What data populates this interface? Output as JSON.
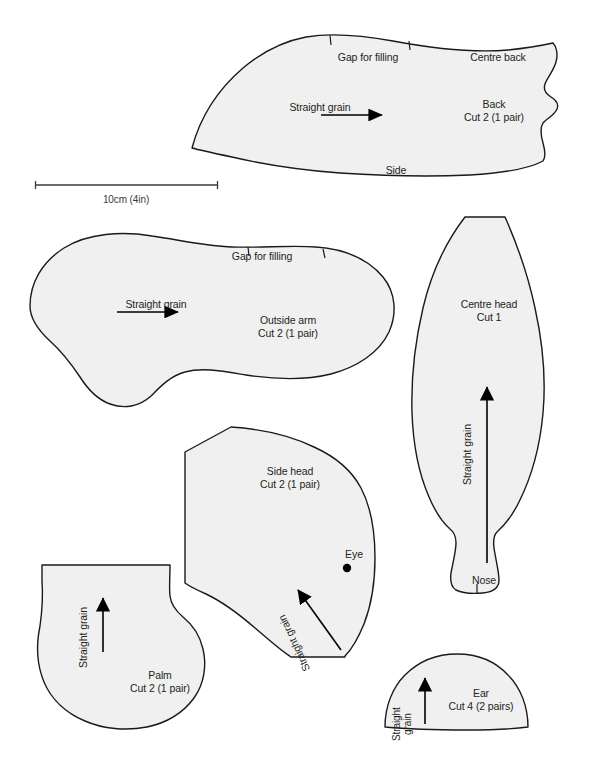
{
  "sheet": {
    "title": "Teddy bear sewing pattern sheet",
    "background_color": "#ffffff",
    "piece_fill_color": "#f0f0f0",
    "piece_stroke_color": "#1a1a1a",
    "text_color": "#231f20",
    "width": 597,
    "height": 762
  },
  "scale_bar": {
    "label": "10cm (4in)",
    "start_x": 35,
    "end_x": 218,
    "y": 185
  },
  "pieces": [
    {
      "id": "back",
      "name": "Back",
      "cut": "Cut 2 (1 pair)",
      "grain_label": "Straight grain",
      "grain_direction": "right",
      "edge_labels": [
        {
          "text": "Gap for filling",
          "position": "top"
        },
        {
          "text": "Centre back",
          "position": "top-right"
        },
        {
          "text": "Side",
          "position": "bottom"
        }
      ],
      "notches": 2
    },
    {
      "id": "outside-arm",
      "name": "Outside arm",
      "cut": "Cut 2 (1 pair)",
      "grain_label": "Straight grain",
      "grain_direction": "right",
      "edge_labels": [
        {
          "text": "Gap for filling",
          "position": "top"
        }
      ],
      "notches": 2
    },
    {
      "id": "centre-head",
      "name": "Centre head",
      "cut": "Cut 1",
      "grain_label": "Straight grain",
      "grain_direction": "up",
      "edge_labels": [
        {
          "text": "Nose",
          "position": "bottom"
        }
      ],
      "notches": 1
    },
    {
      "id": "side-head",
      "name": "Side head",
      "cut": "Cut 2 (1 pair)",
      "grain_label": "Straight grain",
      "grain_direction": "up-left",
      "markers": [
        {
          "text": "Eye",
          "type": "dot"
        }
      ],
      "notches": 0
    },
    {
      "id": "palm",
      "name": "Palm",
      "cut": "Cut 2 (1 pair)",
      "grain_label": "Straight grain",
      "grain_direction": "up",
      "notches": 0
    },
    {
      "id": "ear",
      "name": "Ear",
      "cut": "Cut 4 (2 pairs)",
      "grain_label_line1": "Straight",
      "grain_label_line2": "grain",
      "grain_direction": "up",
      "notches": 0
    }
  ],
  "labels": {
    "back_name": "Back",
    "back_cut": "Cut 2 (1 pair)",
    "back_gap": "Gap for filling",
    "back_centre": "Centre back",
    "back_side": "Side",
    "back_grain": "Straight grain",
    "arm_name": "Outside arm",
    "arm_cut": "Cut 2 (1 pair)",
    "arm_gap": "Gap for filling",
    "arm_grain": "Straight grain",
    "centre_head_name": "Centre head",
    "centre_head_cut": "Cut 1",
    "centre_head_grain": "Straight grain",
    "centre_head_nose": "Nose",
    "side_head_name": "Side head",
    "side_head_cut": "Cut 2 (1 pair)",
    "side_head_grain": "Straight grain",
    "side_head_eye": "Eye",
    "palm_name": "Palm",
    "palm_cut": "Cut 2 (1 pair)",
    "palm_grain": "Straight grain",
    "ear_name": "Ear",
    "ear_cut": "Cut 4 (2 pairs)",
    "ear_grain_line1": "Straight",
    "ear_grain_line2": "grain",
    "scale": "10cm (4in)"
  }
}
